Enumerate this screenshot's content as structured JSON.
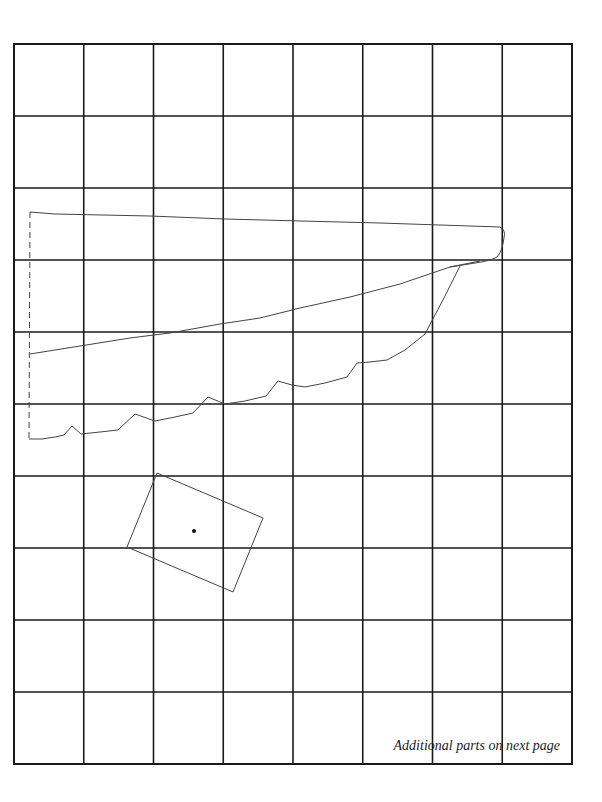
{
  "page": {
    "type": "sewing pattern grid",
    "grid": {
      "columns": 8,
      "rows": 10
    }
  },
  "pieces": [
    {
      "name": "wing-piece",
      "description": "long tapered piece with scalloped lower edge and dashed fold line on left"
    },
    {
      "name": "square-piece",
      "description": "rotated rectangular piece with center dot marker"
    }
  ],
  "footnote": "Additional parts on next page"
}
